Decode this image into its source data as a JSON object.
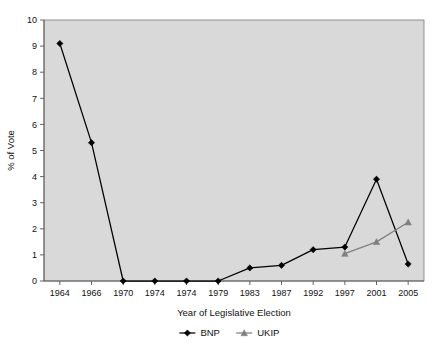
{
  "chart_data": {
    "type": "line",
    "title": "",
    "subtitle": "",
    "xlabel": "Year of Legislative Election",
    "ylabel": "% of Vote",
    "categories": [
      "1964",
      "1966",
      "1970",
      "1974",
      "1974",
      "1979",
      "1983",
      "1987",
      "1992",
      "1997",
      "2001",
      "2005"
    ],
    "ylim": [
      0,
      10
    ],
    "yticks": [
      "0",
      "1",
      "2",
      "3",
      "4",
      "5",
      "6",
      "7",
      "8",
      "9",
      "10"
    ],
    "grid": false,
    "legend_position": "bottom",
    "plot_background": "#d9d9d9",
    "series": [
      {
        "name": "BNP",
        "color": "#000000",
        "marker": "diamond",
        "values": [
          9.1,
          5.3,
          0.0,
          0.0,
          0.0,
          0.0,
          0.5,
          0.6,
          1.2,
          1.3,
          3.9,
          0.65
        ]
      },
      {
        "name": "UKIP",
        "color": "#808080",
        "marker": "triangle",
        "values": [
          null,
          null,
          null,
          null,
          null,
          null,
          null,
          null,
          null,
          1.05,
          1.5,
          2.25
        ]
      }
    ]
  }
}
